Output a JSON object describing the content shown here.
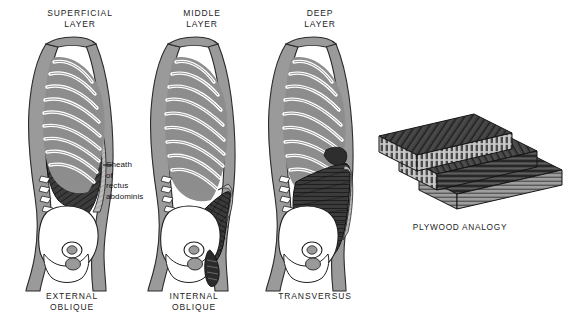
{
  "figure": {
    "title_hidden": "Layers of the abdominal wall musculature",
    "panels": [
      {
        "id": "superficial",
        "header": "SUPERFICIAL\nLAYER",
        "footer": "EXTERNAL\nOBLIQUE",
        "muscle_name": "external oblique",
        "fiber_direction": "downward and forward (infero-medial)"
      },
      {
        "id": "middle",
        "header": "MIDDLE\nLAYER",
        "footer": "INTERNAL\nOBLIQUE",
        "muscle_name": "internal oblique",
        "fiber_direction": "upward and forward (supero-medial), fan-shaped"
      },
      {
        "id": "deep",
        "header": "DEEP\nLAYER",
        "footer": "TRANSVERSUS",
        "muscle_name": "transversus abdominis",
        "fiber_direction": "horizontal (transverse)"
      }
    ],
    "annotation": {
      "text": "Sheath\nof\nrectus\nabdominis",
      "leader": "dash pointing left to the rectus sheath"
    },
    "plywood": {
      "label": "PLYWOOD ANALOGY",
      "boards": [
        {
          "id": "top",
          "grain": "diagonal-left"
        },
        {
          "id": "middle",
          "grain": "diagonal-right"
        },
        {
          "id": "bottom",
          "grain": "horizontal"
        }
      ]
    },
    "colors": {
      "background": "#ffffff",
      "ink": "#1a1a1a",
      "skin_outline": "#9a9a9a",
      "bone_white": "#ffffff",
      "intercostal_gray": "#8e8e8e",
      "muscle_dark": "#3a3a3a",
      "muscle_mid": "#585858",
      "aponeurosis_light": "#b6b6b6",
      "wood_dark": "#3d3d3d",
      "wood_mid": "#6e6e6e",
      "wood_light": "#a8a8a8"
    }
  }
}
